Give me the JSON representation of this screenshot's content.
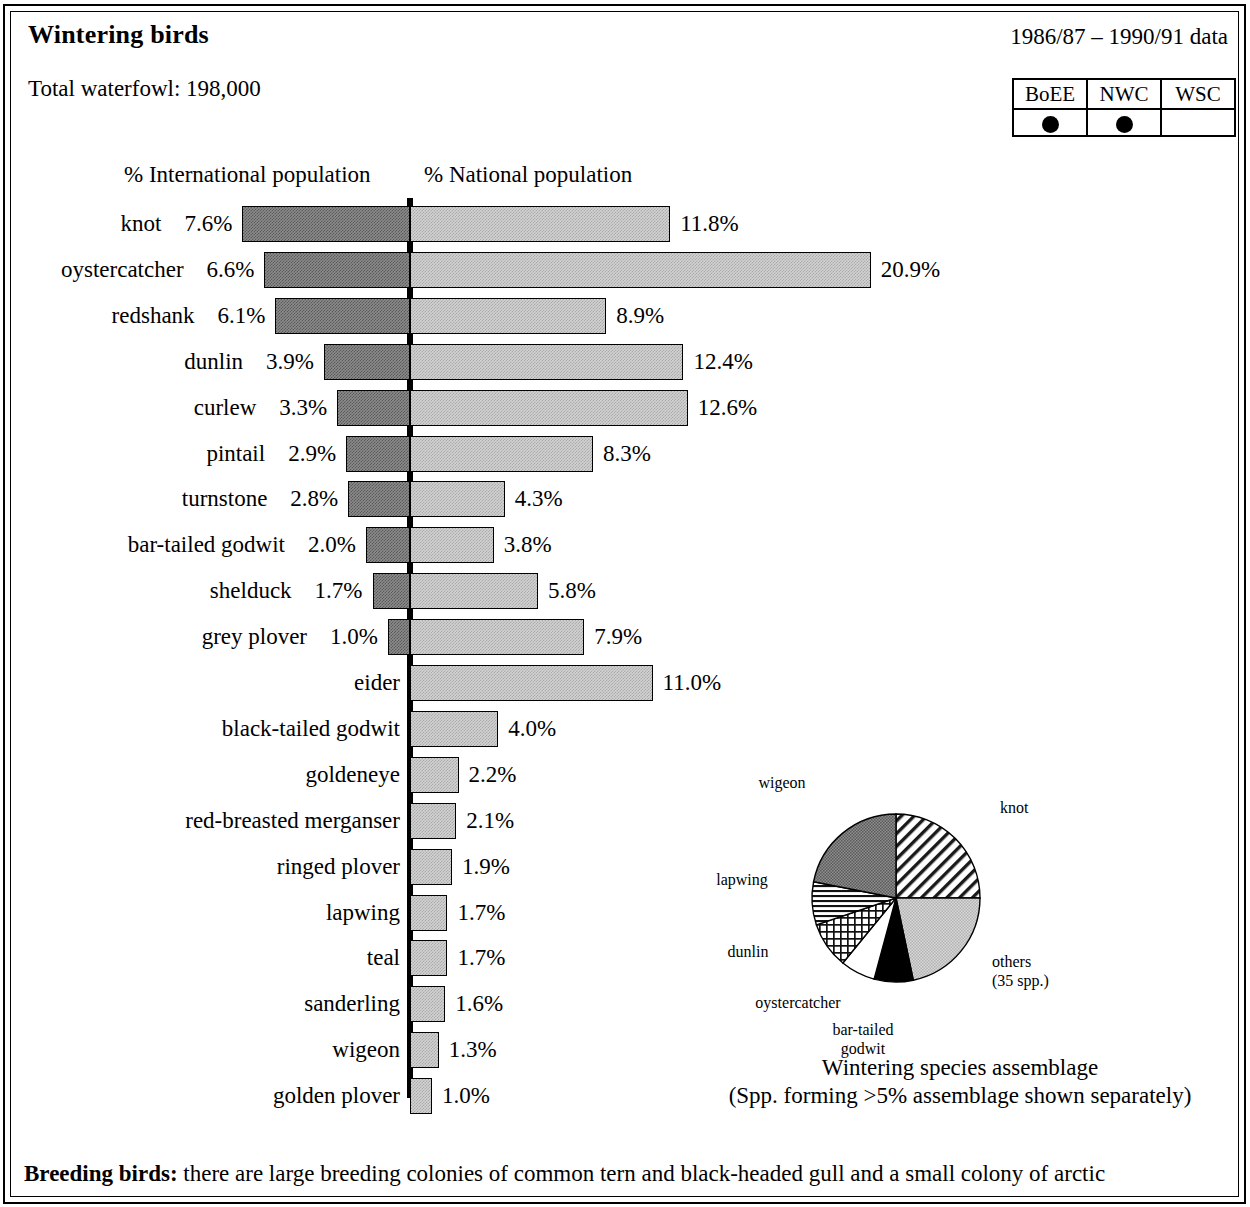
{
  "header": {
    "title": "Wintering birds",
    "date_range": "1986/87 – 1990/91 data",
    "total_waterfowl": "Total waterfowl: 198,000"
  },
  "designations": {
    "columns": [
      "BoEE",
      "NWC",
      "WSC"
    ],
    "marked": [
      true,
      true,
      false
    ],
    "marker_icon": "filled-circle-icon"
  },
  "chart_data": {
    "type": "bar",
    "orientation": "diverging-horizontal",
    "title": "Wintering birds",
    "left_axis_label": "% International population",
    "right_axis_label": "% National population",
    "xlim": [
      0,
      21
    ],
    "grid": false,
    "categories": [
      "knot",
      "oystercatcher",
      "redshank",
      "dunlin",
      "curlew",
      "pintail",
      "turnstone",
      "bar-tailed godwit",
      "shelduck",
      "grey plover",
      "eider",
      "black-tailed godwit",
      "goldeneye",
      "red-breasted merganser",
      "ringed plover",
      "lapwing",
      "teal",
      "sanderling",
      "wigeon",
      "golden plover"
    ],
    "series": [
      {
        "name": "% International population",
        "side": "left",
        "values": [
          7.6,
          6.6,
          6.1,
          3.9,
          3.3,
          2.9,
          2.8,
          2.0,
          1.7,
          1.0,
          null,
          null,
          null,
          null,
          null,
          null,
          null,
          null,
          null,
          null
        ],
        "labels": [
          "7.6%",
          "6.6%",
          "6.1%",
          "3.9%",
          "3.3%",
          "2.9%",
          "2.8%",
          "2.0%",
          "1.7%",
          "1.0%",
          "",
          "",
          "",
          "",
          "",
          "",
          "",
          "",
          "",
          ""
        ]
      },
      {
        "name": "% National population",
        "side": "right",
        "values": [
          11.8,
          20.9,
          8.9,
          12.4,
          12.6,
          8.3,
          4.3,
          3.8,
          5.8,
          7.9,
          11.0,
          4.0,
          2.2,
          2.1,
          1.9,
          1.7,
          1.7,
          1.6,
          1.3,
          1.0
        ],
        "labels": [
          "11.8%",
          "20.9%",
          "8.9%",
          "12.4%",
          "12.6%",
          "8.3%",
          "4.3%",
          "3.8%",
          "5.8%",
          "7.9%",
          "11.0%",
          "4.0%",
          "2.2%",
          "2.1%",
          "1.9%",
          "1.7%",
          "1.7%",
          "1.6%",
          "1.3%",
          "1.0%"
        ]
      }
    ]
  },
  "pie_chart": {
    "type": "pie",
    "title": "Wintering species assemblage",
    "subtitle": "(Spp. forming >5% assemblage shown separately)",
    "slices": [
      {
        "label": "knot",
        "percent": 25.0,
        "fill": "diagonal-hatch"
      },
      {
        "label": "others\n(35 spp.)",
        "percent": 21.7,
        "fill": "light-stipple"
      },
      {
        "label": "bar-tailed\ngodwit",
        "percent": 7.5,
        "fill": "solid-black"
      },
      {
        "label": "oystercatcher",
        "percent": 6.7,
        "fill": "white"
      },
      {
        "label": "dunlin",
        "percent": 8.9,
        "fill": "cross-hatch"
      },
      {
        "label": "lapwing",
        "percent": 8.3,
        "fill": "horizontal-lines"
      },
      {
        "label": "wigeon",
        "percent": 21.9,
        "fill": "dark-stipple"
      }
    ]
  },
  "footer": {
    "breeding_label": "Breeding birds:",
    "breeding_text": " there are large breeding colonies of common tern and black-headed gull and a small colony of arctic"
  }
}
